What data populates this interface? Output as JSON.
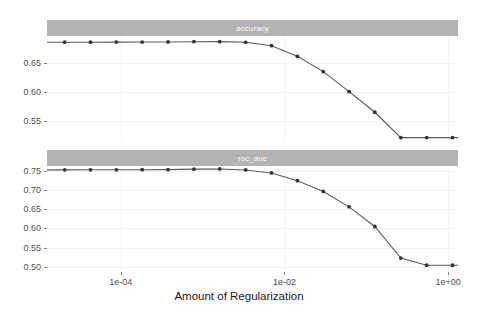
{
  "figure": {
    "background": "#ffffff",
    "strip_fill": "#b3b3b3",
    "strip_text_color": "#ffffff",
    "line_color": "#595959",
    "point_color": "#333333",
    "grid_color": "#f2f2f2"
  },
  "axis": {
    "x_title": "Amount of Regularization",
    "x_tick_labels": [
      "1e-04",
      "1e-02",
      "1e+00"
    ],
    "x_tick_values": [
      0.0001,
      0.01,
      1
    ],
    "x_scale": "log10",
    "x_domain_log": [
      -4.9,
      0.12
    ]
  },
  "panels": [
    {
      "strip_label": "accuracy",
      "y_tick_labels": [
        "0.65",
        "0.60",
        "0.55"
      ],
      "y_tick_values": [
        0.65,
        0.6,
        0.55
      ],
      "ylim": [
        0.515,
        0.695
      ]
    },
    {
      "strip_label": "roc_auc",
      "y_tick_labels": [
        "0.75",
        "0.70",
        "0.65",
        "0.60",
        "0.55",
        "0.50"
      ],
      "y_tick_values": [
        0.75,
        0.7,
        0.65,
        0.6,
        0.55,
        0.5
      ],
      "ylim": [
        0.487,
        0.762
      ]
    }
  ],
  "chart_data": {
    "type": "line",
    "title": "",
    "xlabel": "Amount of Regularization",
    "ylabel": "",
    "xscale": "log",
    "layout": "2 vertically stacked facet panels sharing the x axis",
    "grid": true,
    "legend": "none",
    "x": [
      1e-05,
      2.07e-05,
      4.28e-05,
      8.86e-05,
      0.000183,
      0.000379,
      0.000785,
      0.00162,
      0.00336,
      0.00695,
      0.0144,
      0.0298,
      0.0616,
      0.127,
      0.264,
      0.546,
      1.13,
      2.34,
      4.83,
      10.0
    ],
    "facets": [
      {
        "name": "accuracy",
        "ylabel": "accuracy",
        "ylim": [
          0.515,
          0.695
        ],
        "yticks": [
          0.55,
          0.6,
          0.65
        ],
        "values": [
          0.6845,
          0.6845,
          0.6845,
          0.6846,
          0.6847,
          0.6849,
          0.6853,
          0.6854,
          0.6843,
          0.6785,
          0.6605,
          0.6345,
          0.6005,
          0.5655,
          0.5225,
          0.5225,
          0.5225,
          0.5225,
          0.5225,
          0.5225
        ]
      },
      {
        "name": "roc_auc",
        "ylabel": "roc_auc",
        "ylim": [
          0.487,
          0.762
        ],
        "yticks": [
          0.5,
          0.55,
          0.6,
          0.65,
          0.7,
          0.75
        ],
        "values": [
          0.752,
          0.752,
          0.7521,
          0.7522,
          0.7524,
          0.7527,
          0.7538,
          0.7543,
          0.7518,
          0.744,
          0.724,
          0.696,
          0.656,
          0.605,
          0.523,
          0.5045,
          0.5045,
          0.5045,
          0.5045,
          0.5045
        ]
      }
    ]
  }
}
